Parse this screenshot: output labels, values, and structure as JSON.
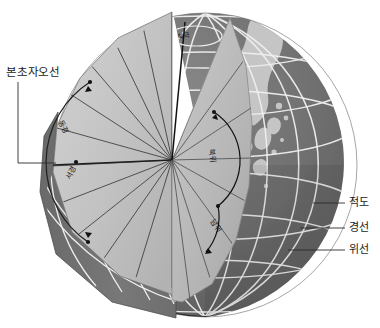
{
  "figure": {
    "type": "cutaway-globe-diagram"
  },
  "labels": {
    "prime_meridian": "본초자오선",
    "equator": "적도",
    "meridian": "경선",
    "parallel": "위선",
    "north_pole": "북극",
    "east_longitude": "동경",
    "west_longitude": "서경",
    "north_latitude": "북위",
    "south_latitude": "남위"
  },
  "colors": {
    "sphere_dark": "#6f6f6f",
    "sphere_shadow": "#5d5d5d",
    "land": "#c9c9c9",
    "cut_face_light": "#c3c3c3",
    "cut_face_mid": "#b3b3b3",
    "cut_face_dark": "#a0a0a0",
    "rim_band": "#8e8e8e",
    "grid_white": "#f2f2f2",
    "line_dark": "#2b2b2b",
    "label_text": "#1a1a1a",
    "background": "#ffffff"
  },
  "geometry": {
    "globe_center_x": 205,
    "globe_center_y": 165,
    "globe_radius": 152,
    "wedge_apex_x": 172,
    "wedge_apex_y": 160,
    "meridian_count": 24,
    "parallel_count": 7
  }
}
